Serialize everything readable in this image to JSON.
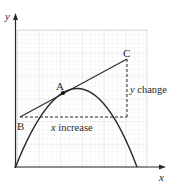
{
  "diagram": {
    "type": "tangent-gradient-diagram",
    "axes": {
      "x_label": "x",
      "y_label": "y"
    },
    "points": {
      "A": {
        "label": "A"
      },
      "B": {
        "label": "B"
      },
      "C": {
        "label": "C"
      }
    },
    "annotations": {
      "y_change": {
        "var": "y",
        "text": " change"
      },
      "x_increase": {
        "var": "x",
        "text": " increase"
      }
    },
    "colors": {
      "ink": "#2a2a2a",
      "grid_minor": "#e4e4e4",
      "grid_major": "#cfcfcf",
      "background": "#ffffff"
    }
  }
}
